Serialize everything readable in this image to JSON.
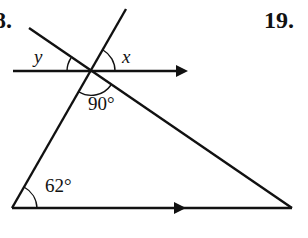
{
  "problems": {
    "left_number": "8.",
    "right_number": "19."
  },
  "labels": {
    "angle_y": "y",
    "angle_x": "x",
    "angle_right": "90°",
    "angle_bottom_left": "62°"
  },
  "colors": {
    "stroke": "#111111",
    "background": "#ffffff"
  },
  "geometry": {
    "intersection": [
      91,
      71
    ],
    "top_parallel_line": {
      "start": [
        13,
        71
      ],
      "arrow_tip": [
        187,
        71
      ]
    },
    "bottom_parallel_line": {
      "start": [
        12,
        208
      ],
      "end": [
        292,
        208
      ],
      "arrow_tip": [
        185,
        208
      ]
    },
    "transversal_left": {
      "start": [
        12,
        208
      ],
      "end": [
        126,
        9
      ]
    },
    "transversal_right": {
      "start": [
        29,
        28
      ],
      "end": [
        292,
        208
      ]
    },
    "angles": [
      "y",
      "x",
      "90°",
      "62°"
    ]
  }
}
